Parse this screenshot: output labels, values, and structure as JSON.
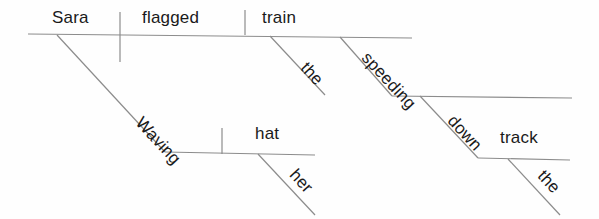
{
  "diagram": {
    "type": "reed-kellogg-sentence-diagram",
    "sentence": "Waving her hat, Sara flagged the speeding train down the track.",
    "line_color": "#8c8c8c",
    "text_color": "#1a1a1a",
    "background": "#fefefe",
    "words": {
      "subject": "Sara",
      "verb": "flagged",
      "direct_object": "train",
      "object_article": "the",
      "object_participle": "speeding",
      "preposition": "down",
      "prep_object": "track",
      "prep_object_article": "the",
      "participle": "Waving",
      "participle_object": "hat",
      "participle_object_modifier": "her"
    }
  }
}
